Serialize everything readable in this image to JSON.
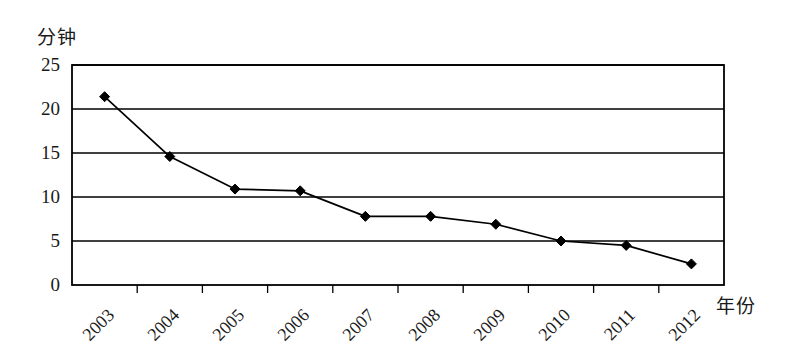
{
  "chart_data": {
    "type": "line",
    "title": "",
    "subtitle": "",
    "xlabel": "年份",
    "ylabel": "分钟",
    "categories": [
      "2003",
      "2004",
      "2005",
      "2006",
      "2007",
      "2008",
      "2009",
      "2010",
      "2011",
      "2012"
    ],
    "values": [
      21.4,
      14.6,
      10.9,
      10.7,
      7.8,
      7.8,
      6.9,
      5.0,
      4.5,
      2.4
    ],
    "series": [
      {
        "name": "分钟",
        "values": [
          21.4,
          14.6,
          10.9,
          10.7,
          7.8,
          7.8,
          6.9,
          5.0,
          4.5,
          2.4
        ]
      }
    ],
    "ylim": [
      0,
      25
    ],
    "yticks": [
      "0",
      "5",
      "10",
      "15",
      "20",
      "25"
    ],
    "ytick_values": [
      0,
      5,
      10,
      15,
      20,
      25
    ],
    "grid": "horizontal",
    "legend": "none",
    "marker": "diamond",
    "line_color": "#000000",
    "marker_color": "#000000",
    "grid_color": "#000000",
    "frame_color": "#000000",
    "background": "#ffffff",
    "xtick_rotation": -45,
    "annotations": []
  }
}
